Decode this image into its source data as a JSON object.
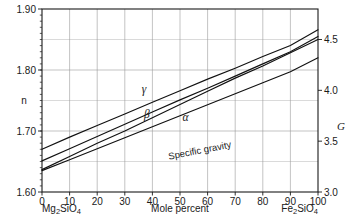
{
  "chart_data": {
    "type": "line",
    "title": "",
    "subtitle": "",
    "xlabel": "Mole percent",
    "ylabel": "n",
    "y2label": "G",
    "xlim": [
      0,
      100
    ],
    "ylim": [
      1.6,
      1.9
    ],
    "y2lim": [
      3.0,
      4.8
    ],
    "grid": true,
    "legend": "inline-curve-labels",
    "x_ticks": [
      "0",
      "10",
      "20",
      "30",
      "40",
      "50",
      "60",
      "70",
      "80",
      "90",
      "100"
    ],
    "x_tick_values": [
      0,
      10,
      20,
      30,
      40,
      50,
      60,
      70,
      80,
      90,
      100
    ],
    "y_ticks": [
      "1.60",
      "1.70",
      "1.80",
      "1.90"
    ],
    "y_tick_values": [
      1.6,
      1.7,
      1.8,
      1.9
    ],
    "y_minor_values": [
      1.65,
      1.75,
      1.85
    ],
    "y2_ticks": [
      "3.0",
      "3.5",
      "4.0",
      "4.5"
    ],
    "y2_tick_values": [
      3.0,
      3.5,
      4.0,
      4.5
    ],
    "x_endpoint_left": "Mg2SiO4",
    "x_endpoint_right": "Fe2SiO4",
    "annotations": [
      {
        "name": "gamma-curve-label",
        "text": "γ",
        "x": 37,
        "y": 1.763
      },
      {
        "name": "beta-curve-label",
        "text": "β",
        "x": 38,
        "y": 1.722
      },
      {
        "name": "alpha-curve-label",
        "text": "α",
        "x": 52,
        "y": 1.716
      },
      {
        "name": "specific-gravity-curve-label",
        "text": "Specific gravity",
        "x": 46,
        "y": 1.653
      }
    ],
    "series": [
      {
        "name": "gamma",
        "label": "γ",
        "axis": "left",
        "x": [
          0,
          10,
          20,
          30,
          40,
          50,
          60,
          70,
          80,
          90,
          100
        ],
        "values": [
          1.67,
          1.69,
          1.709,
          1.728,
          1.747,
          1.766,
          1.785,
          1.803,
          1.822,
          1.84,
          1.866
        ]
      },
      {
        "name": "beta",
        "label": "β",
        "axis": "left",
        "x": [
          0,
          10,
          20,
          30,
          40,
          50,
          60,
          70,
          80,
          90,
          100
        ],
        "values": [
          1.651,
          1.671,
          1.691,
          1.711,
          1.731,
          1.751,
          1.77,
          1.79,
          1.81,
          1.83,
          1.855
        ]
      },
      {
        "name": "alpha",
        "label": "α",
        "axis": "left",
        "x": [
          0,
          10,
          20,
          30,
          40,
          50,
          60,
          70,
          80,
          90,
          100
        ],
        "values": [
          1.635,
          1.653,
          1.671,
          1.689,
          1.707,
          1.725,
          1.743,
          1.761,
          1.779,
          1.797,
          1.82
        ]
      },
      {
        "name": "specific_gravity",
        "label": "Specific gravity",
        "axis": "right",
        "x": [
          0,
          10,
          20,
          30,
          40,
          50,
          60,
          70,
          80,
          90,
          100
        ],
        "values": [
          3.22,
          3.35,
          3.48,
          3.6,
          3.73,
          3.86,
          3.99,
          4.12,
          4.24,
          4.37,
          4.5
        ]
      }
    ],
    "colors": {
      "curve": "#111111",
      "grid": "#9a9a9a",
      "frame": "#1a1a1a",
      "text": "#1a1a1a",
      "background": "#ffffff"
    }
  }
}
